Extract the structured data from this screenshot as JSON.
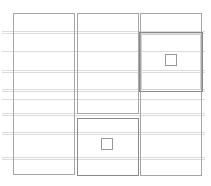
{
  "canvas": {
    "width": 211,
    "height": 186,
    "background": "#ffffff"
  },
  "colors": {
    "guide_line": "#dcdcdc",
    "box_border": "#a6a6a6",
    "emphasis_border": "#8a8a8a",
    "inner_border": "#d2d2d2",
    "square_border": "#989898",
    "fill": "#ffffff"
  },
  "guide_lines": {
    "x_start": 2,
    "x_end": 205,
    "rows": [
      {
        "y": 31,
        "double": true
      },
      {
        "y": 51,
        "double": false
      },
      {
        "y": 70,
        "double": true
      },
      {
        "y": 89,
        "double": true
      },
      {
        "y": 99,
        "double": false
      },
      {
        "y": 113,
        "double": true
      },
      {
        "y": 132,
        "double": true
      },
      {
        "y": 157,
        "double": true
      }
    ]
  },
  "boxes": [
    {
      "name": "left-column-box",
      "x": 13,
      "y": 13,
      "w": 62,
      "h": 162,
      "emphasis": false,
      "double": false
    },
    {
      "name": "middle-top-box",
      "x": 77,
      "y": 13,
      "w": 62,
      "h": 101,
      "emphasis": false,
      "double": false
    },
    {
      "name": "middle-bottom-box",
      "x": 77,
      "y": 118,
      "w": 62,
      "h": 58,
      "emphasis": true,
      "double": false
    },
    {
      "name": "right-column-box",
      "x": 140,
      "y": 13,
      "w": 62,
      "h": 163,
      "emphasis": false,
      "double": false
    },
    {
      "name": "right-feature-box",
      "x": 139,
      "y": 32,
      "w": 64,
      "h": 60,
      "emphasis": true,
      "double": true
    }
  ],
  "placeholder_squares": [
    {
      "name": "right-placeholder-square",
      "x": 165,
      "y": 54,
      "size": 12
    },
    {
      "name": "middle-placeholder-square",
      "x": 101,
      "y": 138,
      "size": 12
    }
  ]
}
